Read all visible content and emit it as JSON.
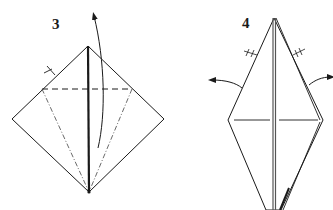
{
  "diagram": {
    "type": "origami-instructions",
    "colors": {
      "line": "#1a1a1a",
      "background": "#ffffff"
    },
    "steps": [
      {
        "label": "3",
        "description": "Square base viewed as diamond; valley fold top flap upward along horizontal dashed line, with dash-dot valley lines from corners to bottom point",
        "symbols": [
          "valley-fold-line",
          "mountain-fold-line",
          "fold-up-arrow",
          "equal-angle-tick"
        ]
      },
      {
        "label": "4",
        "description": "Narrow kite shape; open out both side flaps (arrows pointing outward)",
        "symbols": [
          "valley-fold-line",
          "fold-out-arrow-left",
          "fold-out-arrow-right",
          "equal-angle-tick-left",
          "equal-angle-tick-right"
        ]
      }
    ]
  }
}
